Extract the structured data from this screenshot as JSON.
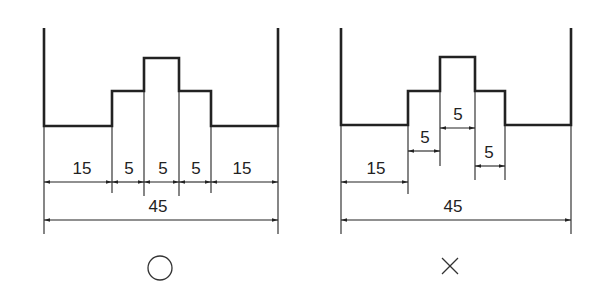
{
  "left_figure": {
    "verdict_symbol": "○",
    "verdict_meaning": "correct",
    "dims": [
      "15",
      "5",
      "5",
      "5",
      "15"
    ],
    "total": "45"
  },
  "right_figure": {
    "verdict_symbol": "×",
    "verdict_meaning": "incorrect",
    "dims": [
      "15",
      "5",
      "5",
      "5"
    ],
    "total": "45"
  }
}
